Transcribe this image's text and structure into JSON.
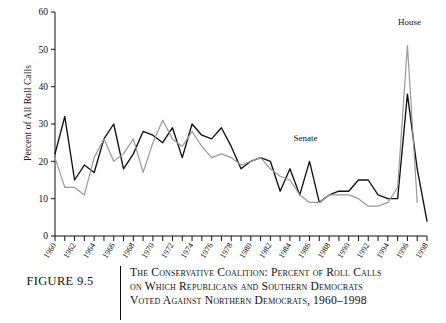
{
  "figure": {
    "number_label": "FIGURE 9.5",
    "caption_lines": [
      "The Conservative Coalition: Percent of Roll Calls",
      "on Which Republicans and Southern Democrats",
      "Voted Against Northern Democrats, 1960–1998"
    ]
  },
  "annotations": {
    "house_label": "House",
    "senate_label": "Senate"
  },
  "chart_data": {
    "type": "line",
    "title": "",
    "xlabel": "",
    "ylabel": "Percent of All Roll Calls",
    "xlim": [
      1960,
      1998
    ],
    "ylim": [
      0,
      60
    ],
    "yticks": [
      0,
      10,
      20,
      30,
      40,
      50,
      60
    ],
    "ytick_labels": [
      "0",
      "10",
      "20",
      "30",
      "40",
      "50",
      "60"
    ],
    "grid": false,
    "legend_position": "inline-annotation",
    "x": [
      1960,
      1961,
      1962,
      1963,
      1964,
      1965,
      1966,
      1967,
      1968,
      1969,
      1970,
      1971,
      1972,
      1973,
      1974,
      1975,
      1976,
      1977,
      1978,
      1979,
      1980,
      1981,
      1982,
      1983,
      1984,
      1985,
      1986,
      1987,
      1988,
      1989,
      1990,
      1991,
      1992,
      1993,
      1994,
      1995,
      1996,
      1997,
      1998
    ],
    "xtick_labels": [
      "1960",
      "1962",
      "1964",
      "1966",
      "1968",
      "1970",
      "1972",
      "1974",
      "1976",
      "1978",
      "1980",
      "1982",
      "1984",
      "1986",
      "1988",
      "1990",
      "1992",
      "1994",
      "1996",
      "1998"
    ],
    "series": [
      {
        "name": "Senate",
        "color": "#111111",
        "values": [
          22,
          32,
          15,
          19,
          17,
          26,
          30,
          18,
          22,
          28,
          27,
          25,
          29,
          21,
          30,
          27,
          26,
          29,
          24,
          18,
          20,
          21,
          20,
          12,
          18,
          11,
          20,
          9,
          11,
          12,
          12,
          15,
          15,
          11,
          10,
          10,
          38,
          18,
          4
        ]
      },
      {
        "name": "House",
        "color": "#999999",
        "values": [
          21,
          13,
          13,
          11,
          21,
          26,
          20,
          22,
          26,
          17,
          25,
          31,
          26,
          24,
          28,
          24,
          21,
          22,
          21,
          19,
          20,
          21,
          18,
          16,
          15,
          11,
          9,
          9,
          11,
          11,
          11,
          10,
          8,
          8,
          9,
          13,
          51,
          9,
          null
        ]
      }
    ]
  }
}
